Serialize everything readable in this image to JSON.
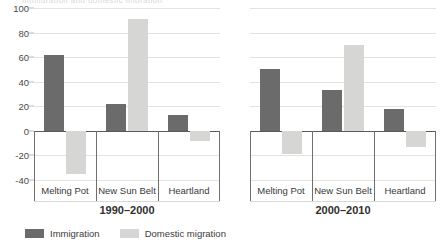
{
  "figure": {
    "clipped_top_text": "Immigration and domestic migration",
    "legend": [
      {
        "key": "immigration",
        "label": "Immigration",
        "color": "#6b6b6b"
      },
      {
        "key": "domestic",
        "label": "Domestic migration",
        "color": "#d6d6d4"
      }
    ]
  },
  "axis": {
    "ticks": [
      "100",
      "80",
      "60",
      "40",
      "20",
      "0",
      "-20",
      "-40"
    ]
  },
  "panels": [
    {
      "period": "1990–2000",
      "categories": [
        "Melting Pot",
        "New Sun Belt",
        "Heartland"
      ]
    },
    {
      "period": "2000–2010",
      "categories": [
        "Melting Pot",
        "New Sun Belt",
        "Heartland"
      ]
    }
  ],
  "chart_data": {
    "type": "bar",
    "title": "Immigration and domestic migration",
    "xlabel": "",
    "ylabel": "",
    "ylim": [
      -40,
      100
    ],
    "ytick_values": [
      100,
      80,
      60,
      40,
      20,
      0,
      -20,
      -40
    ],
    "grid": true,
    "legend_position": "bottom-left",
    "categories": [
      "Melting Pot",
      "New Sun Belt",
      "Heartland"
    ],
    "panels": [
      {
        "period": "1990–2000",
        "series": [
          {
            "name": "Immigration",
            "color": "#6b6b6b",
            "values": [
              62,
              22,
              13
            ]
          },
          {
            "name": "Domestic migration",
            "color": "#d6d6d4",
            "values": [
              -35,
              91,
              -8
            ]
          }
        ]
      },
      {
        "period": "2000–2010",
        "series": [
          {
            "name": "Immigration",
            "color": "#6b6b6b",
            "values": [
              50,
              33,
              18
            ]
          },
          {
            "name": "Domestic migration",
            "color": "#d6d6d4",
            "values": [
              -19,
              70,
              -13
            ]
          }
        ]
      }
    ]
  }
}
